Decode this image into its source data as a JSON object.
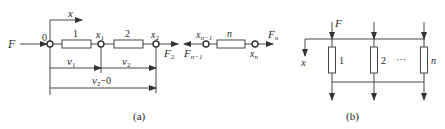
{
  "figure_a": {
    "caption": "(a)",
    "axis_label": "x",
    "force_in": "F",
    "origin_label": "0",
    "elements": [
      {
        "label": "1"
      },
      {
        "label": "2"
      },
      {
        "label": "n"
      }
    ],
    "nodes": {
      "x1": {
        "base": "x",
        "sub": "1"
      },
      "x2": {
        "base": "x",
        "sub": "2"
      },
      "xn_1": {
        "base": "x",
        "sub": "n−1"
      },
      "xn": {
        "base": "x",
        "sub": "n"
      }
    },
    "forces": {
      "F2": {
        "base": "F",
        "sub": "2"
      },
      "Fn_1": {
        "base": "F",
        "sub": "n−1"
      },
      "Fn": {
        "base": "F",
        "sub": "n"
      }
    },
    "displacements": {
      "v1": {
        "base": "v",
        "sub": "1"
      },
      "v2": {
        "base": "v",
        "sub": "2"
      },
      "v2_0": {
        "base": "v",
        "sub": "2",
        "suffix": "−0"
      }
    }
  },
  "figure_b": {
    "caption": "(b)",
    "force_label": "F",
    "axis_label": "x",
    "elements": [
      {
        "label": "1"
      },
      {
        "label": "2"
      },
      {
        "label": "n"
      }
    ],
    "ellipsis": "···"
  },
  "colors": {
    "stroke": "#333333",
    "text": "#2a2a2a",
    "background": "#ffffff"
  }
}
